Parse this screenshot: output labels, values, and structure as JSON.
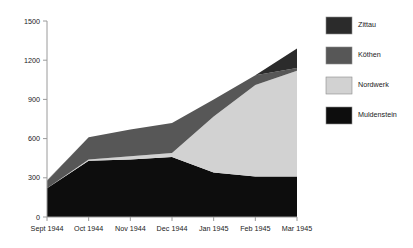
{
  "chart_data": {
    "type": "area",
    "stacked": true,
    "title": "",
    "subtitle": "",
    "xlabel": "",
    "ylabel": "",
    "categories": [
      "Sept 1944",
      "Oct 1944",
      "Nov 1944",
      "Dec 1944",
      "Jan 1945",
      "Feb 1945",
      "Mar 1945"
    ],
    "ylim": [
      0,
      1500
    ],
    "yticks": [
      0,
      300,
      600,
      900,
      1200,
      1500
    ],
    "ytick_labels": [
      "0",
      "300",
      "600",
      "900",
      "1200",
      "1500"
    ],
    "grid": false,
    "legend_position": "right",
    "stack_order_bottom_to_top": [
      "Muldenstein",
      "Nordwerk",
      "Köthen",
      "Zittau"
    ],
    "series": [
      {
        "name": "Muldenstein",
        "color": "#0d0d0d",
        "values": [
          220,
          430,
          440,
          460,
          340,
          310,
          310
        ]
      },
      {
        "name": "Nordwerk",
        "color": "#d2d2d2",
        "values": [
          0,
          10,
          25,
          30,
          430,
          700,
          810
        ]
      },
      {
        "name": "Köthen",
        "color": "#575757",
        "values": [
          55,
          170,
          205,
          230,
          130,
          75,
          20
        ]
      },
      {
        "name": "Zittau",
        "color": "#2b2b2b",
        "values": [
          5,
          0,
          0,
          0,
          0,
          0,
          150
        ]
      }
    ],
    "totals": [
      280,
      610,
      670,
      720,
      900,
      1085,
      1290
    ]
  },
  "legend": {
    "items": [
      {
        "label": "Zittau",
        "color": "#2b2b2b"
      },
      {
        "label": "Köthen",
        "color": "#575757"
      },
      {
        "label": "Nordwerk",
        "color": "#d2d2d2"
      },
      {
        "label": "Muldenstein",
        "color": "#0d0d0d"
      }
    ]
  },
  "axes": {
    "y_tick_labels": [
      "1500",
      "1200",
      "900",
      "600",
      "300",
      "0"
    ],
    "x_tick_labels": [
      "Sept 1944",
      "Oct 1944",
      "Nov 1944",
      "Dec 1944",
      "Jan 1945",
      "Feb 1945",
      "Mar 1945"
    ]
  }
}
